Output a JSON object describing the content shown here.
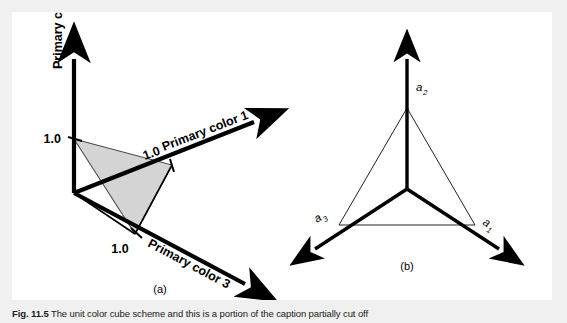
{
  "figure": {
    "background_color": "#f0f0f0",
    "card_color": "#ffffff",
    "line_color": "#000000",
    "triangle_fill": "#d4d4d4"
  },
  "panel_a": {
    "sublabel": "(a)",
    "axes": [
      {
        "id": "axis-1",
        "label": "Primary color 1",
        "tick": "1.0"
      },
      {
        "id": "axis-2",
        "label": "Primary color 2",
        "tick": "1.0"
      },
      {
        "id": "axis-3",
        "label": "Primary color 3",
        "tick": "1.0"
      }
    ],
    "axis1_label": "Primary color 1",
    "axis2_label": "Primary color 2",
    "axis3_label": "Primary color 3",
    "tick1": "1.0",
    "tick2": "1.0",
    "tick3": "1.0"
  },
  "panel_b": {
    "sublabel": "(b)",
    "vectors": [
      {
        "id": "vector-a1",
        "label": "a",
        "subscript": "1"
      },
      {
        "id": "vector-a2",
        "label": "a",
        "subscript": "2"
      },
      {
        "id": "vector-a3",
        "label": "a",
        "subscript": "3"
      }
    ],
    "a1_base": "a",
    "a1_sub": "1",
    "a2_base": "a",
    "a2_sub": "2",
    "a3_base": "a",
    "a3_sub": "3"
  },
  "caption": {
    "number": "Fig. 11.5",
    "text": "The unit color cube scheme and this is a portion of the caption partially cut off"
  }
}
